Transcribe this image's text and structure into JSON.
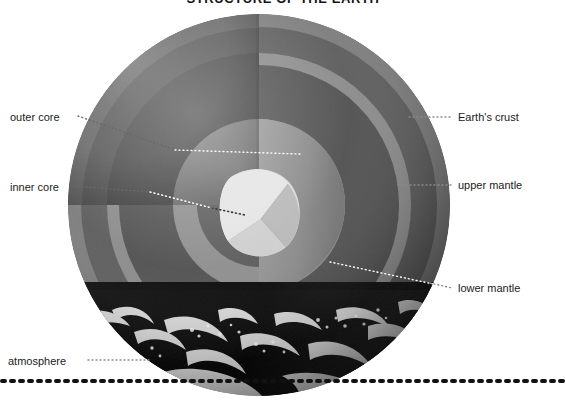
{
  "title": "STRUCTURE OF THE EARTH",
  "labels": {
    "left": [
      {
        "id": "outer-core",
        "text": "outer core",
        "x": 10,
        "y": 111,
        "dot_from_x": 78,
        "dot_from_y": 116,
        "target_x": 175,
        "target_y": 150
      },
      {
        "id": "inner-core",
        "text": "inner core",
        "x": 10,
        "y": 181,
        "dot_from_x": 74,
        "dot_from_y": 186,
        "target_x": 238,
        "target_y": 212
      },
      {
        "id": "atmosphere",
        "text": "atmosphere",
        "x": 8,
        "y": 355,
        "dot_from_x": 88,
        "dot_from_y": 360,
        "target_x": 150,
        "target_y": 360
      }
    ],
    "right": [
      {
        "id": "earths-crust",
        "text": "Earth's crust",
        "x": 458,
        "y": 111,
        "dot_from_x": 409,
        "dot_from_y": 117,
        "target_x": 452,
        "target_y": 117
      },
      {
        "id": "upper-mantle",
        "text": "upper mantle",
        "x": 458,
        "y": 179,
        "dot_from_x": 398,
        "dot_from_y": 185,
        "target_x": 452,
        "target_y": 185
      },
      {
        "id": "lower-mantle",
        "text": "lower mantle",
        "x": 458,
        "y": 282,
        "dot_from_x": 380,
        "dot_from_y": 265,
        "target_x": 452,
        "target_y": 288
      }
    ]
  },
  "layers": [
    {
      "id": "crust",
      "name": "Earth's crust",
      "color": "#6f6f6f",
      "radius_ratio": 1.0
    },
    {
      "id": "upper-mantle",
      "name": "upper mantle",
      "color": "#575757",
      "radius_ratio": 0.93
    },
    {
      "id": "lower-mantle",
      "name": "lower mantle",
      "color": "#4d4d4d",
      "radius_ratio": 0.8
    },
    {
      "id": "outer-core",
      "name": "outer core",
      "color": "#8d8d8d",
      "radius_ratio": 0.45
    },
    {
      "id": "inner-core",
      "name": "inner core",
      "color": "#d6d6d6",
      "radius_ratio": 0.2
    }
  ],
  "colors": {
    "background": "#ffffff",
    "text": "#1b1b1b",
    "title": "#141414",
    "surface_dark": "#0a0a0a",
    "cloud": "#f2f2f2",
    "rule": "#111111",
    "leader_light": "#ffffff",
    "leader_dark": "#4a4a4a"
  },
  "globe": {
    "center_x": 259,
    "center_y": 205,
    "radius": 191
  }
}
